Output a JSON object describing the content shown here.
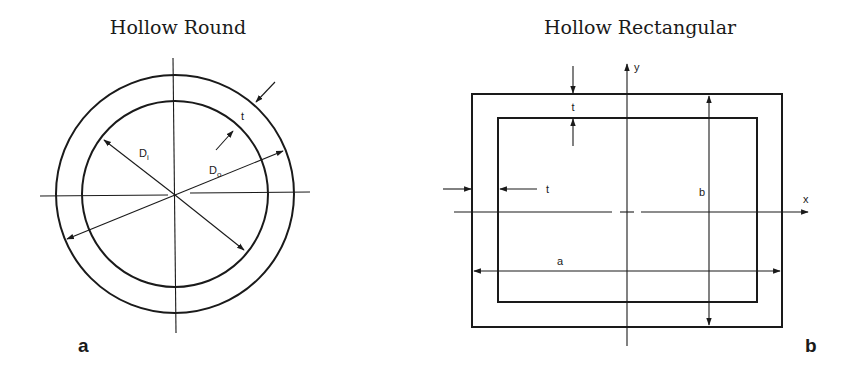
{
  "figure_a": {
    "title": "Hollow Round",
    "panel_label": "a",
    "labels": {
      "inner_diameter_main": "D",
      "inner_diameter_sub": "i",
      "outer_diameter_main": "D",
      "outer_diameter_sub": "o",
      "thickness": "t"
    }
  },
  "figure_b": {
    "title": "Hollow Rectangular",
    "panel_label": "b",
    "labels": {
      "thickness_top": "t",
      "thickness_side": "t",
      "width": "a",
      "height": "b",
      "x_axis": "x",
      "y_axis": "y"
    }
  },
  "colors": {
    "line": "#1a1a1a",
    "background": "#ffffff"
  }
}
